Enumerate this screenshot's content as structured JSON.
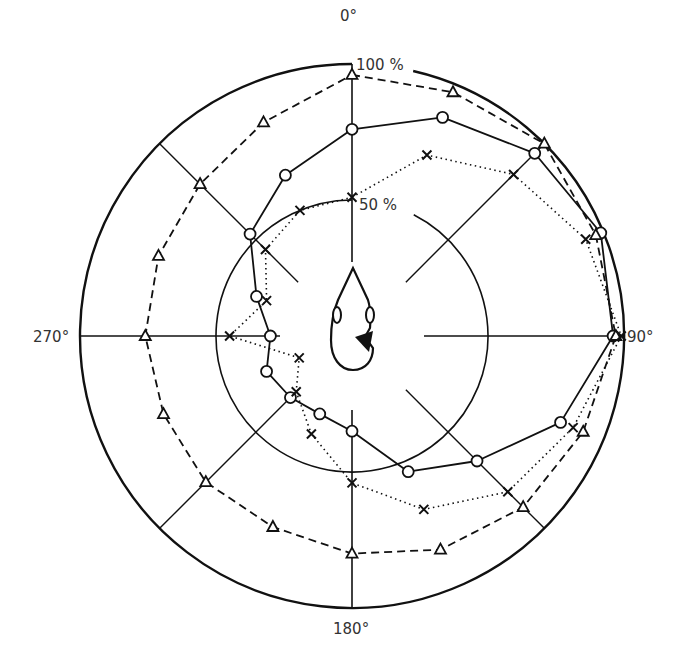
{
  "chart_data": {
    "type": "polar-line",
    "title": "",
    "angle_unit": "degrees",
    "angle_direction": "clockwise from top",
    "angles": [
      0,
      22.5,
      45,
      67.5,
      90,
      112.5,
      135,
      157.5,
      180,
      202.5,
      225,
      247.5,
      270,
      292.5,
      315,
      337.5
    ],
    "axis_labels": [
      {
        "angle": 0,
        "text": "0°"
      },
      {
        "angle": 90,
        "text": "90°"
      },
      {
        "angle": 180,
        "text": "180°"
      },
      {
        "angle": 270,
        "text": "270°"
      }
    ],
    "ring_labels": [
      {
        "value": 100,
        "text": "100 %"
      },
      {
        "value": 50,
        "text": "50 %"
      }
    ],
    "rlim": [
      0,
      100
    ],
    "series": [
      {
        "name": "circles",
        "marker": "circle",
        "line": "solid",
        "values": [
          76,
          87,
          95,
          99,
          96,
          83,
          65,
          54,
          35,
          31,
          32,
          34,
          30,
          38,
          53,
          64
        ]
      },
      {
        "name": "triangles",
        "marker": "triangle",
        "line": "dashed",
        "values": [
          96,
          97,
          100,
          97,
          97,
          92,
          89,
          85,
          80,
          76,
          76,
          75,
          76,
          77,
          79,
          85
        ]
      },
      {
        "name": "crosses",
        "marker": "cross",
        "line": "dotted",
        "values": [
          51,
          72,
          84,
          93,
          99,
          88,
          81,
          69,
          54,
          39,
          29,
          21,
          45,
          34,
          45,
          50
        ]
      }
    ],
    "legend": null,
    "grid": {
      "rings": [
        50,
        100
      ],
      "spokes": 8
    },
    "center_figure": "head outline viewed from above with ears, nose pointing to 0°, black sound source wedge on right side"
  },
  "colors": {
    "ink": "#111111",
    "label": "#333333",
    "background": "#ffffff"
  }
}
